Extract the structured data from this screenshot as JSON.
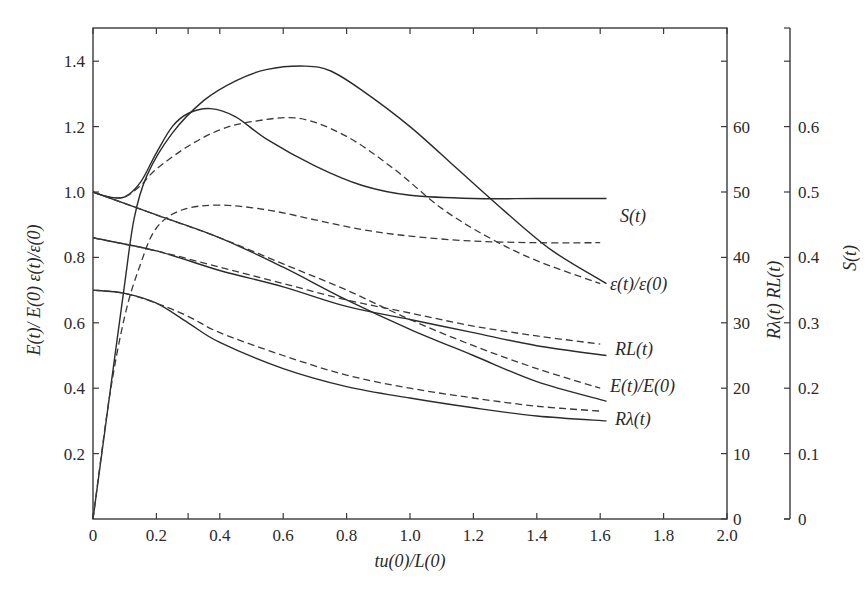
{
  "chart_data": {
    "type": "line",
    "title": "",
    "xlabel": "tu(0)/L(0)",
    "ylabel_left": "E(t)/ E(0) ε(t)/ε(0)",
    "ylabel_right_1": "Rλ(t) RL(t)",
    "ylabel_right_2": "S(t)",
    "xlim": [
      0,
      2.0
    ],
    "ylim_left": [
      0,
      1.5
    ],
    "ylim_right_1": [
      0,
      75
    ],
    "ylim_right_2": [
      0,
      0.75
    ],
    "x_ticks": [
      "0",
      "0.2",
      "0.4",
      "0.6",
      "0.8",
      "1.0",
      "1.2",
      "1.4",
      "1.6",
      "1.8",
      "2.0"
    ],
    "x_minor_ticks": [
      0.3
    ],
    "y_left_ticks": [
      "0.2",
      "0.4",
      "0.6",
      "0.8",
      "1.0",
      "1.2",
      "1.4"
    ],
    "y_left_zero": "0",
    "y_right1_ticks": [
      "0",
      "10",
      "20",
      "30",
      "40",
      "50",
      "60"
    ],
    "y_right2_ticks": [
      "0",
      "0.1",
      "0.2",
      "0.3",
      "0.4",
      "0.5",
      "0.6"
    ],
    "grid": false,
    "legend": "inline labels at right end of curves",
    "series": [
      {
        "name": "S(t)",
        "style": "solid",
        "axis": "S (scaled ×2 to left axis)",
        "points": [
          [
            0,
            1.0
          ],
          [
            0.05,
            0.985
          ],
          [
            0.1,
            0.985
          ],
          [
            0.15,
            1.03
          ],
          [
            0.2,
            1.12
          ],
          [
            0.25,
            1.2
          ],
          [
            0.3,
            1.24
          ],
          [
            0.37,
            1.255
          ],
          [
            0.45,
            1.23
          ],
          [
            0.55,
            1.16
          ],
          [
            0.7,
            1.08
          ],
          [
            0.85,
            1.02
          ],
          [
            1.0,
            0.99
          ],
          [
            1.2,
            0.98
          ],
          [
            1.4,
            0.98
          ],
          [
            1.62,
            0.98
          ]
        ]
      },
      {
        "name": "S(t) model",
        "style": "dashed",
        "axis": "S (scaled ×2 to left axis)",
        "points": [
          [
            0,
            1.0
          ],
          [
            0.05,
            0.985
          ],
          [
            0.1,
            0.985
          ],
          [
            0.15,
            1.02
          ],
          [
            0.2,
            1.07
          ],
          [
            0.3,
            1.14
          ],
          [
            0.4,
            1.19
          ],
          [
            0.5,
            1.215
          ],
          [
            0.65,
            1.225
          ],
          [
            0.8,
            1.17
          ],
          [
            0.95,
            1.07
          ],
          [
            1.1,
            0.95
          ],
          [
            1.25,
            0.86
          ],
          [
            1.4,
            0.79
          ],
          [
            1.6,
            0.72
          ]
        ]
      },
      {
        "name": "ε(t)/ε(0)",
        "style": "solid",
        "axis": "left",
        "points": [
          [
            0,
            0.0
          ],
          [
            0.05,
            0.36
          ],
          [
            0.1,
            0.72
          ],
          [
            0.13,
            0.92
          ],
          [
            0.17,
            1.05
          ],
          [
            0.25,
            1.18
          ],
          [
            0.35,
            1.28
          ],
          [
            0.45,
            1.34
          ],
          [
            0.55,
            1.375
          ],
          [
            0.67,
            1.385
          ],
          [
            0.75,
            1.37
          ],
          [
            0.85,
            1.31
          ],
          [
            1.0,
            1.2
          ],
          [
            1.15,
            1.07
          ],
          [
            1.3,
            0.94
          ],
          [
            1.45,
            0.82
          ],
          [
            1.62,
            0.72
          ]
        ]
      },
      {
        "name": "ε(t)/ε(0) model",
        "style": "dashed",
        "axis": "left",
        "points": [
          [
            0,
            0.0
          ],
          [
            0.05,
            0.36
          ],
          [
            0.1,
            0.62
          ],
          [
            0.15,
            0.78
          ],
          [
            0.2,
            0.89
          ],
          [
            0.28,
            0.945
          ],
          [
            0.4,
            0.96
          ],
          [
            0.55,
            0.945
          ],
          [
            0.7,
            0.915
          ],
          [
            0.85,
            0.885
          ],
          [
            1.0,
            0.865
          ],
          [
            1.2,
            0.85
          ],
          [
            1.4,
            0.845
          ],
          [
            1.6,
            0.845
          ]
        ]
      },
      {
        "name": "E(t)/E(0)",
        "style": "solid",
        "axis": "left",
        "points": [
          [
            0,
            1.0
          ],
          [
            0.2,
            0.93
          ],
          [
            0.4,
            0.86
          ],
          [
            0.6,
            0.77
          ],
          [
            0.8,
            0.67
          ],
          [
            1.0,
            0.58
          ],
          [
            1.2,
            0.5
          ],
          [
            1.4,
            0.42
          ],
          [
            1.62,
            0.36
          ]
        ]
      },
      {
        "name": "E(t)/E(0) model",
        "style": "dashed",
        "axis": "left",
        "points": [
          [
            0,
            1.0
          ],
          [
            0.2,
            0.93
          ],
          [
            0.4,
            0.86
          ],
          [
            0.6,
            0.78
          ],
          [
            0.8,
            0.7
          ],
          [
            1.0,
            0.61
          ],
          [
            1.2,
            0.53
          ],
          [
            1.4,
            0.46
          ],
          [
            1.6,
            0.4
          ]
        ]
      },
      {
        "name": "RL(t)",
        "style": "solid",
        "axis": "R (scaled ÷50 to left axis)",
        "points": [
          [
            0,
            0.86
          ],
          [
            0.2,
            0.82
          ],
          [
            0.4,
            0.76
          ],
          [
            0.6,
            0.71
          ],
          [
            0.8,
            0.65
          ],
          [
            1.0,
            0.61
          ],
          [
            1.2,
            0.57
          ],
          [
            1.4,
            0.53
          ],
          [
            1.62,
            0.5
          ]
        ]
      },
      {
        "name": "RL(t) model",
        "style": "dashed",
        "axis": "R (scaled ÷50 to left axis)",
        "points": [
          [
            0,
            0.86
          ],
          [
            0.2,
            0.82
          ],
          [
            0.4,
            0.77
          ],
          [
            0.6,
            0.72
          ],
          [
            0.8,
            0.67
          ],
          [
            1.0,
            0.63
          ],
          [
            1.2,
            0.59
          ],
          [
            1.4,
            0.56
          ],
          [
            1.6,
            0.535
          ]
        ]
      },
      {
        "name": "Rλ(t)",
        "style": "solid",
        "axis": "R (scaled ÷50 to left axis)",
        "points": [
          [
            0,
            0.7
          ],
          [
            0.1,
            0.69
          ],
          [
            0.2,
            0.66
          ],
          [
            0.3,
            0.6
          ],
          [
            0.4,
            0.54
          ],
          [
            0.6,
            0.46
          ],
          [
            0.8,
            0.405
          ],
          [
            1.0,
            0.37
          ],
          [
            1.2,
            0.34
          ],
          [
            1.4,
            0.315
          ],
          [
            1.62,
            0.3
          ]
        ]
      },
      {
        "name": "Rλ(t) model",
        "style": "dashed",
        "axis": "R (scaled ÷50 to left axis)",
        "points": [
          [
            0,
            0.7
          ],
          [
            0.1,
            0.69
          ],
          [
            0.2,
            0.66
          ],
          [
            0.3,
            0.62
          ],
          [
            0.4,
            0.57
          ],
          [
            0.6,
            0.5
          ],
          [
            0.8,
            0.44
          ],
          [
            1.0,
            0.4
          ],
          [
            1.2,
            0.37
          ],
          [
            1.4,
            0.345
          ],
          [
            1.6,
            0.33
          ]
        ]
      }
    ],
    "annotations": [
      {
        "text": "S(t)",
        "x": 1.7,
        "y": 0.93
      },
      {
        "text": "ε(t)/ε(0)",
        "x": 1.7,
        "y": 0.715
      },
      {
        "text": "RL(t)",
        "x": 1.7,
        "y": 0.52
      },
      {
        "text": "E(t)/E(0)",
        "x": 1.7,
        "y": 0.4
      },
      {
        "text": "Rλ(t)",
        "x": 1.7,
        "y": 0.3
      }
    ]
  },
  "labels": {
    "xlabel": "tu(0)/L(0)",
    "ylabel_left": "E(t)/ E(0) ε(t)/ε(0)",
    "ylabel_right_1": "Rλ(t) RL(t)",
    "ylabel_right_2": "S(t)",
    "curve_S": "S(t)",
    "curve_eps": "ε(t)/ε(0)",
    "curve_RL": "RL(t)",
    "curve_E": "E(t)/E(0)",
    "curve_Rlam": "Rλ(t)"
  }
}
